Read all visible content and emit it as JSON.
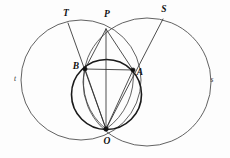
{
  "figure": {
    "type": "geometry-diagram",
    "canvas": {
      "width": 230,
      "height": 158,
      "background": "#fdfdfd"
    },
    "colors": {
      "thin_stroke": "#3a3a3a",
      "bold_stroke": "#1a1a1a",
      "chord_stroke": "#2f2f2f",
      "dot_fill": "#111111",
      "label_fill": "#111111"
    },
    "circles": [
      {
        "id": "circle-t",
        "label": "t",
        "cx": 81,
        "cy": 80,
        "r": 60,
        "weight": "thin",
        "label_x": 15,
        "label_y": 79
      },
      {
        "id": "circle-s",
        "label": "s",
        "cx": 147,
        "cy": 82,
        "r": 64,
        "weight": "thin",
        "label_x": 212,
        "label_y": 80
      },
      {
        "id": "circle-inner",
        "label": "",
        "cx": 106.5,
        "cy": 94.5,
        "r": 35,
        "weight": "bold",
        "label_x": 0,
        "label_y": 0
      }
    ],
    "points": [
      {
        "id": "T",
        "label": "T",
        "x": 68,
        "y": 23,
        "dot": false,
        "label_x": 66,
        "label_y": 14
      },
      {
        "id": "P",
        "label": "P",
        "x": 106,
        "y": 29,
        "dot": false,
        "label_x": 107,
        "label_y": 15
      },
      {
        "id": "S",
        "label": "S",
        "x": 163,
        "y": 19,
        "dot": false,
        "label_x": 164,
        "label_y": 10
      },
      {
        "id": "B",
        "label": "B",
        "x": 85,
        "y": 69,
        "dot": true,
        "label_x": 76,
        "label_y": 67
      },
      {
        "id": "A",
        "label": "A",
        "x": 133,
        "y": 70,
        "dot": true,
        "label_x": 140,
        "label_y": 73
      },
      {
        "id": "O",
        "label": "O",
        "x": 106,
        "y": 129,
        "dot": true,
        "label_x": 107,
        "label_y": 142
      }
    ],
    "segments": [
      {
        "id": "OT",
        "from": "O",
        "to": "T",
        "through": "B"
      },
      {
        "id": "OP",
        "from": "O",
        "to": "P",
        "through": ""
      },
      {
        "id": "OS",
        "from": "O",
        "to": "S",
        "through": "A"
      },
      {
        "id": "OB",
        "from": "O",
        "to": "B",
        "through": ""
      },
      {
        "id": "OA",
        "from": "O",
        "to": "A",
        "through": ""
      },
      {
        "id": "BA",
        "from": "B",
        "to": "A",
        "through": ""
      }
    ]
  }
}
